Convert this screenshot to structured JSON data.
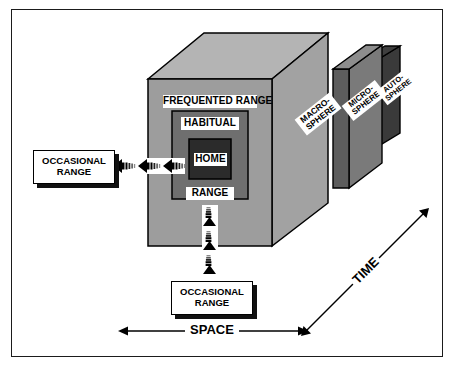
{
  "figure": {
    "background_color": "#ffffff",
    "frame_color": "#1b1b1b"
  },
  "palette": {
    "macro_front": "#9d9d9d",
    "macro_top": "#b4b4b4",
    "macro_side": "#a8a8a8",
    "frequented": "#9d9d9d",
    "habitual": "#6f6f6f",
    "home": "#2b2b2b",
    "micro_front": "#7a7a7a",
    "micro_top": "#8d8d8d",
    "auto_front": "#2a2a2a",
    "auto_top": "#3a3a3a",
    "outline": "#000000",
    "label_text": "#000000",
    "label_bg": "#ffffff"
  },
  "cube_labels": {
    "frequented_range": "FREQUENTED RANGE",
    "habitual": "HABITUAL",
    "range": "RANGE",
    "home": "HOME"
  },
  "spheres": [
    {
      "id": "macro",
      "line1": "MACRO-",
      "line2": "SPHERE"
    },
    {
      "id": "micro",
      "line1": "MICRO-",
      "line2": "SPHERE"
    },
    {
      "id": "auto",
      "line1": "AUTO-",
      "line2": "SPHERE"
    }
  ],
  "callouts": [
    {
      "id": "left",
      "line1": "OCCASIONAL",
      "line2": "RANGE"
    },
    {
      "id": "bottom",
      "line1": "OCCASIONAL",
      "line2": "RANGE"
    }
  ],
  "axes": {
    "space": "SPACE",
    "time": "TIME"
  },
  "arrows": {
    "left_count": 3,
    "left_direction": "left",
    "down_count": 3,
    "down_direction": "down"
  }
}
